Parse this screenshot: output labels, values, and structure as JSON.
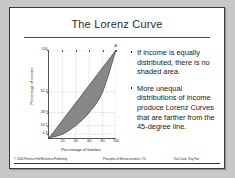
{
  "slide": {
    "title": "The Lorenz Curve",
    "background_color": "#ffffff",
    "border_color": "#3a3a3a",
    "canvas_color": "#c8c8c8"
  },
  "bullets": [
    {
      "text": "If income is equally distributed, there is no shaded area."
    },
    {
      "text": "More unequal distributions of income produce Lorenz Curves that are farther from the 45-degree line."
    }
  ],
  "footer": {
    "left": "© 2004 Prentice Hall Business Publishing",
    "center": "Principles of Microeconomics, 7/e",
    "right": "Karl Case, Ray Fair"
  },
  "chart_data": {
    "type": "line",
    "title": "",
    "xlabel": "Percentage of families",
    "ylabel": "Percentage of income",
    "xlim": [
      0,
      100
    ],
    "ylim": [
      0,
      100
    ],
    "grid": true,
    "grid_style": "dotted",
    "x_ticks": [
      20,
      40,
      60,
      80,
      100
    ],
    "x_tick_labels": [
      "20",
      "40",
      "60",
      "80",
      "100"
    ],
    "y_ticks": [
      4.3,
      14.1,
      28.9,
      52.4,
      100
    ],
    "y_tick_labels": [
      "4.3",
      "14.1",
      "28.9",
      "52.4",
      "100"
    ],
    "annotations": [
      {
        "label": "A",
        "x": 100,
        "y": 100
      }
    ],
    "shaded_region_color": "#6e6e6e",
    "series": [
      {
        "name": "Line of perfect equality (45-degree line)",
        "type": "line",
        "x": [
          0,
          100
        ],
        "values": [
          0,
          100
        ]
      },
      {
        "name": "Lorenz curve",
        "type": "line",
        "x": [
          0,
          20,
          40,
          60,
          80,
          100
        ],
        "values": [
          0,
          4.3,
          14.1,
          28.9,
          52.4,
          100
        ]
      }
    ]
  }
}
